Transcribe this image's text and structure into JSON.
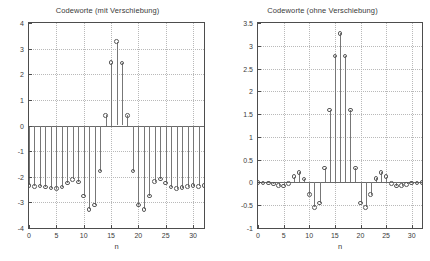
{
  "chart_data": [
    {
      "type": "stem",
      "title": "Codeworte (mit Verschiebung)",
      "xlabel": "n",
      "ylabel": "",
      "xlim": [
        0,
        32
      ],
      "ylim": [
        -4,
        4
      ],
      "xticks": [
        0,
        5,
        10,
        15,
        20,
        25,
        30
      ],
      "yticks": [
        -4,
        -3,
        -2,
        -1,
        0,
        1,
        2,
        3,
        4
      ],
      "xticklabels": [
        "0",
        "5",
        "10",
        "15",
        "20",
        "25",
        "30"
      ],
      "yticklabels": [
        "-4",
        "-3",
        "-2",
        "-1",
        "0",
        "1",
        "2",
        "3",
        "4"
      ],
      "grid": true,
      "marker": "circle",
      "x": [
        0,
        1,
        2,
        3,
        4,
        5,
        6,
        7,
        8,
        9,
        10,
        11,
        12,
        13,
        14,
        15,
        16,
        17,
        18,
        19,
        20,
        21,
        22,
        23,
        24,
        25,
        26,
        27,
        28,
        29,
        30,
        31,
        32
      ],
      "values": [
        -2.33,
        -2.37,
        -2.36,
        -2.4,
        -2.44,
        -2.46,
        -2.4,
        -2.25,
        -2.1,
        -2.2,
        -2.75,
        -3.27,
        -3.1,
        -1.78,
        0.4,
        2.45,
        3.27,
        2.44,
        0.4,
        -1.78,
        -3.11,
        -3.27,
        -2.75,
        -2.19,
        -2.09,
        -2.25,
        -2.4,
        -2.46,
        -2.43,
        -2.39,
        -2.35,
        -2.37,
        -2.33
      ]
    },
    {
      "type": "stem",
      "title": "Codeworte (ohne Verschiebung)",
      "xlabel": "n",
      "ylabel": "",
      "xlim": [
        0,
        32
      ],
      "ylim": [
        -1,
        3.5
      ],
      "xticks": [
        0,
        5,
        10,
        15,
        20,
        25,
        30
      ],
      "yticks": [
        -1,
        -0.5,
        0,
        0.5,
        1,
        1.5,
        2,
        2.5,
        3,
        3.5
      ],
      "xticklabels": [
        "0",
        "5",
        "10",
        "15",
        "20",
        "25",
        "30"
      ],
      "yticklabels": [
        "-1",
        "-0.5",
        "0",
        "0.5",
        "1",
        "1.5",
        "2",
        "2.5",
        "3",
        "3.5"
      ],
      "grid": true,
      "marker": "circle",
      "x": [
        0,
        1,
        2,
        3,
        4,
        5,
        6,
        7,
        8,
        9,
        10,
        11,
        12,
        13,
        14,
        15,
        16,
        17,
        18,
        19,
        20,
        21,
        22,
        23,
        24,
        25,
        26,
        27,
        28,
        29,
        30,
        31,
        32
      ],
      "values": [
        0.0,
        -0.01,
        -0.01,
        -0.03,
        -0.07,
        -0.08,
        -0.02,
        0.13,
        0.22,
        0.08,
        -0.27,
        -0.55,
        -0.45,
        0.32,
        1.59,
        2.78,
        3.27,
        2.78,
        1.59,
        0.32,
        -0.45,
        -0.55,
        -0.27,
        0.09,
        0.22,
        0.13,
        -0.02,
        -0.08,
        -0.07,
        -0.04,
        -0.01,
        -0.01,
        0.0
      ]
    }
  ]
}
